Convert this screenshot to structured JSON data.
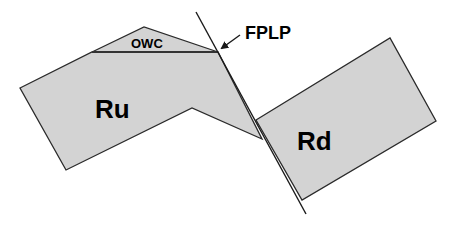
{
  "diagram": {
    "labels": {
      "owc": "OWC",
      "ru": "Ru",
      "rd": "Rd",
      "fplp": "FPLP"
    },
    "colors": {
      "block_fill": "#d3d3d3",
      "stroke": "#2a2a2a",
      "background": "#ffffff"
    },
    "shapes": {
      "ru_polygon": [
        [
          20,
          88
        ],
        [
          92,
          52
        ],
        [
          218,
          52
        ],
        [
          262,
          139
        ],
        [
          192,
          108
        ],
        [
          66,
          170
        ]
      ],
      "owc_triangle": [
        [
          92,
          52
        ],
        [
          144,
          27
        ],
        [
          218,
          52
        ]
      ],
      "rd_rectangle": [
        [
          256,
          120
        ],
        [
          390,
          38
        ],
        [
          436,
          121
        ],
        [
          302,
          200
        ]
      ],
      "fault_line": [
        [
          196,
          12
        ],
        [
          306,
          214
        ]
      ],
      "fplp_arrow": [
        [
          240,
          35
        ],
        [
          220,
          49
        ]
      ]
    }
  }
}
